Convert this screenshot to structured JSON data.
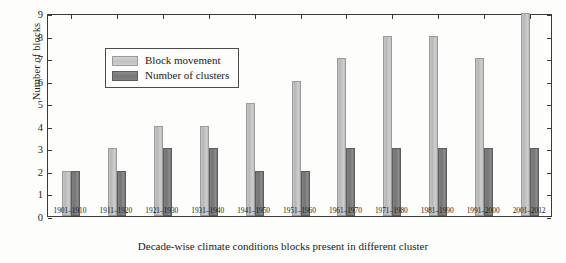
{
  "chart_data": {
    "type": "bar",
    "title": "",
    "xlabel": "Decade-wise climate conditions blocks present in different cluster",
    "ylabel": "Number of blocks",
    "ylim": [
      0,
      9
    ],
    "yticks": [
      0,
      1,
      2,
      3,
      4,
      5,
      6,
      7,
      8,
      9
    ],
    "grid": false,
    "legend_position": "upper-left-inside",
    "categories": [
      "1901–1910",
      "1911–1920",
      "1921–1930",
      "1931–1940",
      "1941–1950",
      "1951–1960",
      "1961–1970",
      "1971–1980",
      "1981–1990",
      "1991–2000",
      "2001–2012"
    ],
    "series": [
      {
        "name": "Block movement",
        "color": "#c4c4c4",
        "values": [
          2,
          3,
          4,
          4,
          5,
          6,
          7,
          8,
          8,
          7,
          9
        ]
      },
      {
        "name": "Number of clusters",
        "color": "#7a7a7a",
        "values": [
          2,
          2,
          3,
          3,
          2,
          2,
          3,
          3,
          3,
          3,
          3
        ]
      }
    ]
  },
  "legend": {
    "items": [
      {
        "label": "Block movement"
      },
      {
        "label": "Number of clusters"
      }
    ]
  }
}
